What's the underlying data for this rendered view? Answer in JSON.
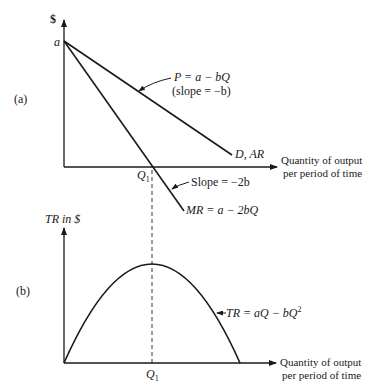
{
  "panel_a": {
    "label": "(a)",
    "y_axis_label": "$",
    "intercept_label": "a",
    "x_axis_label_line1": "Quantity of output",
    "x_axis_label_line2": "per period of time",
    "q1_label": "Q",
    "q1_sub": "1",
    "demand": {
      "equation": "P = a − bQ",
      "slope_note": "(slope = −b)",
      "curve_label": "D, AR"
    },
    "marginal_revenue": {
      "slope_note": "Slope = −2b",
      "equation": "MR = a − 2bQ"
    }
  },
  "panel_b": {
    "label": "(b)",
    "y_axis_label": "TR in $",
    "x_axis_label_line1": "Quantity of output",
    "x_axis_label_line2": "per period of time",
    "q1_label": "Q",
    "q1_sub": "1",
    "total_revenue": {
      "equation": "TR = aQ − bQ",
      "exponent": "2"
    }
  },
  "colors": {
    "ink": "#1a1a1a",
    "background": "#ffffff"
  }
}
